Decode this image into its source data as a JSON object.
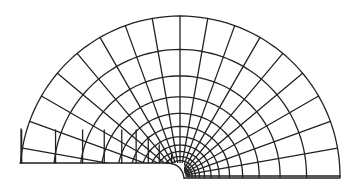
{
  "figure": {
    "title": "",
    "stroke_color": "#222222",
    "background": "#ffffff",
    "center": [
      180,
      176
    ],
    "outer_radius": 160,
    "inner_radius": 6,
    "radial_lines": 19,
    "arc_count": 14,
    "left_baseline_y": 163,
    "right_baseline_y": 178
  }
}
